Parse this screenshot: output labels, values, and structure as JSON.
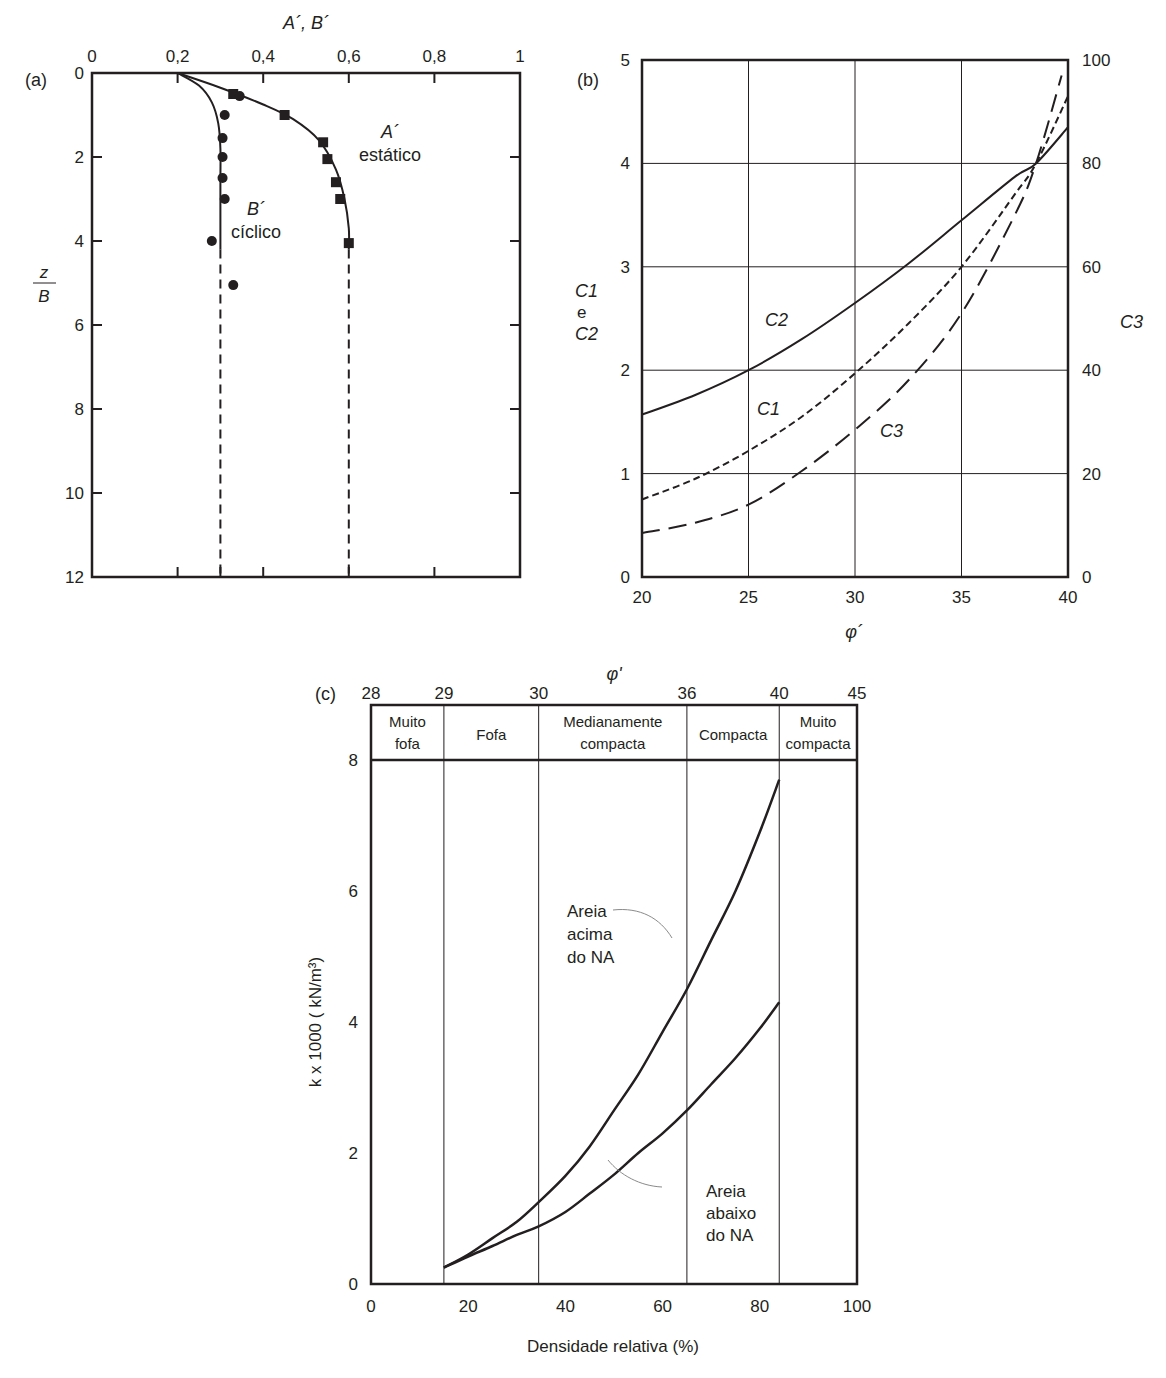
{
  "chart_data": [
    {
      "id": "a",
      "panel_label": "(a)",
      "type": "scatter",
      "title": "",
      "xlabel": "A´, B´",
      "ylabel_num": "z",
      "ylabel_den": "B",
      "x_ticks": [
        "0",
        "0,2",
        "0,4",
        "0,6",
        "0,8",
        "1"
      ],
      "x_tick_values": [
        0,
        0.2,
        0.4,
        0.6,
        0.8,
        1.0
      ],
      "y_ticks": [
        "0",
        "2",
        "4",
        "6",
        "8",
        "10",
        "12"
      ],
      "y_tick_values": [
        0,
        2,
        4,
        6,
        8,
        10,
        12
      ],
      "xlim": [
        0,
        1
      ],
      "ylim": [
        12,
        0
      ],
      "grid": false,
      "series": [
        {
          "name": "A´ estático",
          "label_line1": "A´",
          "label_line2": "estático",
          "marker": "square",
          "points": [
            [
              0.33,
              0.5
            ],
            [
              0.45,
              1.0
            ],
            [
              0.54,
              1.65
            ],
            [
              0.55,
              2.05
            ],
            [
              0.57,
              2.6
            ],
            [
              0.58,
              3.0
            ],
            [
              0.6,
              4.05
            ]
          ],
          "fit_curve": [
            [
              0.2,
              0
            ],
            [
              0.3,
              0.35
            ],
            [
              0.4,
              0.75
            ],
            [
              0.47,
              1.1
            ],
            [
              0.53,
              1.6
            ],
            [
              0.57,
              2.3
            ],
            [
              0.59,
              3.0
            ],
            [
              0.6,
              3.7
            ],
            [
              0.6,
              4.2
            ]
          ],
          "dashed_extension": [
            [
              0.6,
              4.2
            ],
            [
              0.6,
              12
            ]
          ]
        },
        {
          "name": "B´ cíclico",
          "label_line1": "B´",
          "label_line2": "cíclico",
          "marker": "circle",
          "points": [
            [
              0.345,
              0.55
            ],
            [
              0.31,
              1.0
            ],
            [
              0.305,
              1.55
            ],
            [
              0.305,
              2.0
            ],
            [
              0.305,
              2.5
            ],
            [
              0.31,
              3.0
            ],
            [
              0.28,
              4.0
            ],
            [
              0.33,
              5.05
            ]
          ],
          "fit_curve": [
            [
              0.2,
              0
            ],
            [
              0.25,
              0.3
            ],
            [
              0.28,
              0.7
            ],
            [
              0.295,
              1.2
            ],
            [
              0.3,
              1.8
            ],
            [
              0.3,
              2.6
            ],
            [
              0.3,
              4.2
            ]
          ],
          "dashed_extension": [
            [
              0.3,
              4.2
            ],
            [
              0.3,
              12
            ]
          ]
        }
      ]
    },
    {
      "id": "b",
      "panel_label": "(b)",
      "type": "line",
      "title": "",
      "xlabel": "φ´",
      "ylabel_left_line1": "C1",
      "ylabel_left_line2": "e",
      "ylabel_left_line3": "C2",
      "ylabel_right": "C3",
      "x_ticks": [
        "20",
        "25",
        "30",
        "35",
        "40"
      ],
      "x_tick_values": [
        20,
        25,
        30,
        35,
        40
      ],
      "y_left_ticks": [
        "0",
        "1",
        "2",
        "3",
        "4",
        "5"
      ],
      "y_left_values": [
        0,
        1,
        2,
        3,
        4,
        5
      ],
      "y_right_ticks": [
        "0",
        "20",
        "40",
        "60",
        "80",
        "100"
      ],
      "y_right_values": [
        0,
        20,
        40,
        60,
        80,
        100
      ],
      "xlim": [
        20,
        40
      ],
      "ylim_left": [
        0,
        5
      ],
      "ylim_right": [
        0,
        100
      ],
      "grid": true,
      "series": [
        {
          "name": "C2",
          "axis": "left",
          "style": "solid",
          "x": [
            20,
            22.5,
            25,
            27.5,
            30,
            32.5,
            35,
            37.5,
            38.5,
            40
          ],
          "values": [
            1.57,
            1.76,
            2.0,
            2.3,
            2.65,
            3.03,
            3.45,
            3.87,
            4.0,
            4.35
          ]
        },
        {
          "name": "C1",
          "axis": "left",
          "style": "short-dash",
          "x": [
            20,
            22.5,
            25,
            27.5,
            30,
            32.5,
            35,
            37.5,
            38.5,
            40
          ],
          "values": [
            0.75,
            0.95,
            1.22,
            1.55,
            1.97,
            2.45,
            3.0,
            3.7,
            4.0,
            4.65
          ]
        },
        {
          "name": "C3",
          "axis": "right",
          "style": "long-dash",
          "x": [
            20,
            22.5,
            25,
            27.5,
            30,
            32.5,
            35,
            37.5,
            38.5,
            39.7
          ],
          "values": [
            8.5,
            10.5,
            14,
            20.5,
            28.5,
            38,
            51,
            70,
            80,
            97
          ]
        }
      ],
      "annotations": [
        {
          "text": "C2",
          "sub": "2",
          "x": 26.0,
          "y": 2.4
        },
        {
          "text": "C1",
          "sub": "1",
          "x": 25.2,
          "y": 1.5
        },
        {
          "text": "C3",
          "sub": "3",
          "x": 31.5,
          "y": 1.3
        }
      ]
    },
    {
      "id": "c",
      "panel_label": "(c)",
      "type": "line",
      "title": "",
      "xlabel": "Densidade relativa (%)",
      "ylabel": "k x 1000 ( kN/m³)",
      "top_axis_label": "φ'",
      "x_ticks": [
        "0",
        "20",
        "40",
        "60",
        "80",
        "100"
      ],
      "x_tick_values": [
        0,
        20,
        40,
        60,
        80,
        100
      ],
      "y_ticks": [
        "0",
        "2",
        "4",
        "6",
        "8"
      ],
      "y_tick_values": [
        0,
        2,
        4,
        6,
        8
      ],
      "top_ticks": [
        "28",
        "29",
        "30",
        "36",
        "40",
        "45"
      ],
      "top_tick_positions": [
        0,
        15,
        34.5,
        65,
        84,
        100
      ],
      "xlim": [
        0,
        100
      ],
      "ylim": [
        0,
        8
      ],
      "grid": false,
      "zones": [
        {
          "line1": "Muito",
          "line2": "fofa",
          "from": 0,
          "to": 15
        },
        {
          "line1": "Fofa",
          "line2": "",
          "from": 15,
          "to": 34.5
        },
        {
          "line1": "Medianamente",
          "line2": "compacta",
          "from": 34.5,
          "to": 65
        },
        {
          "line1": "Compacta",
          "line2": "",
          "from": 65,
          "to": 84
        },
        {
          "line1": "Muito",
          "line2": "compacta",
          "from": 84,
          "to": 100
        }
      ],
      "series": [
        {
          "name": "Areia acima do NA",
          "label_lines": [
            "Areia",
            "acima",
            "do NA"
          ],
          "x": [
            15,
            20,
            25,
            30,
            34.5,
            40,
            45,
            50,
            55,
            60,
            65,
            70,
            75,
            80,
            84
          ],
          "values": [
            0.25,
            0.45,
            0.7,
            0.95,
            1.25,
            1.65,
            2.1,
            2.65,
            3.2,
            3.85,
            4.5,
            5.25,
            6.0,
            6.9,
            7.7
          ]
        },
        {
          "name": "Areia abaixo do NA",
          "label_lines": [
            "Areia",
            "abaixo",
            "do NA"
          ],
          "x": [
            15,
            20,
            25,
            30,
            34.5,
            40,
            45,
            50,
            55,
            60,
            65,
            70,
            75,
            80,
            84
          ],
          "values": [
            0.25,
            0.42,
            0.58,
            0.75,
            0.88,
            1.1,
            1.38,
            1.67,
            2.0,
            2.3,
            2.65,
            3.05,
            3.45,
            3.9,
            4.3
          ]
        }
      ]
    }
  ]
}
